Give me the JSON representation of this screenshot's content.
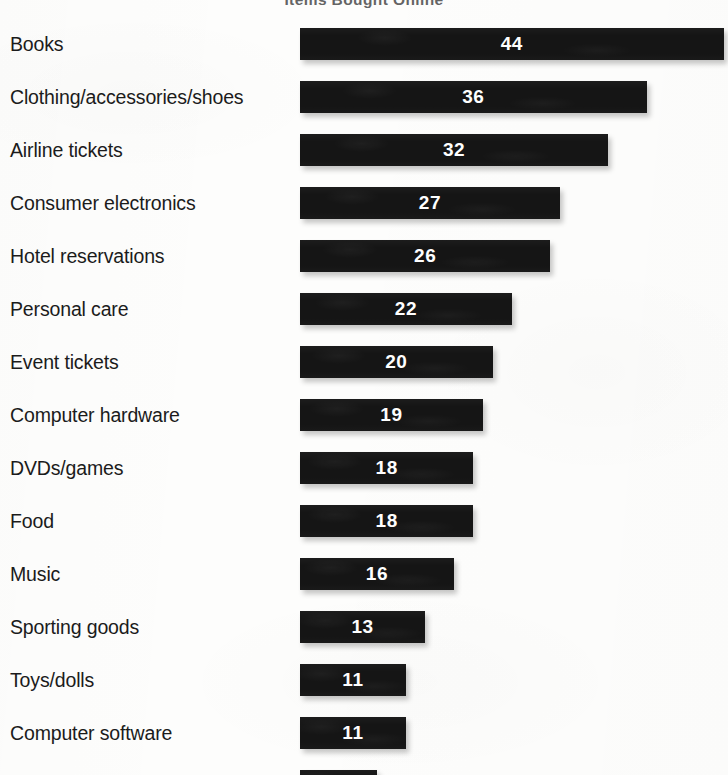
{
  "chart_data": {
    "type": "bar",
    "orientation": "horizontal",
    "title": "Items Bought Online",
    "title_cropped": true,
    "xlabel": "",
    "ylabel": "",
    "xlim": [
      0,
      44
    ],
    "grid": false,
    "legend": null,
    "value_labels_inside_bars": true,
    "bar_color": "#151515",
    "value_label_color": "#ffffff",
    "background_color": "#fdfdfc",
    "categories": [
      "Books",
      "Clothing/accessories/shoes",
      "Airline tickets",
      "Consumer electronics",
      "Hotel reservations",
      "Personal care",
      "Event tickets",
      "Computer hardware",
      "DVDs/games",
      "Food",
      "Music",
      "Sporting goods",
      "Toys/dolls",
      "Computer software",
      "Flowers"
    ],
    "values": [
      44,
      36,
      32,
      27,
      26,
      22,
      20,
      19,
      18,
      18,
      16,
      13,
      11,
      11,
      8
    ],
    "value_labels": [
      "44",
      "36",
      "32",
      "27",
      "26",
      "22",
      "20",
      "19",
      "18",
      "18",
      "16",
      "13",
      "11",
      "11",
      "8"
    ]
  },
  "layout": {
    "bar_origin_x": 300,
    "px_per_unit": 9.63,
    "first_row_top": 28,
    "row_pitch": 53,
    "bar_height": 32
  }
}
